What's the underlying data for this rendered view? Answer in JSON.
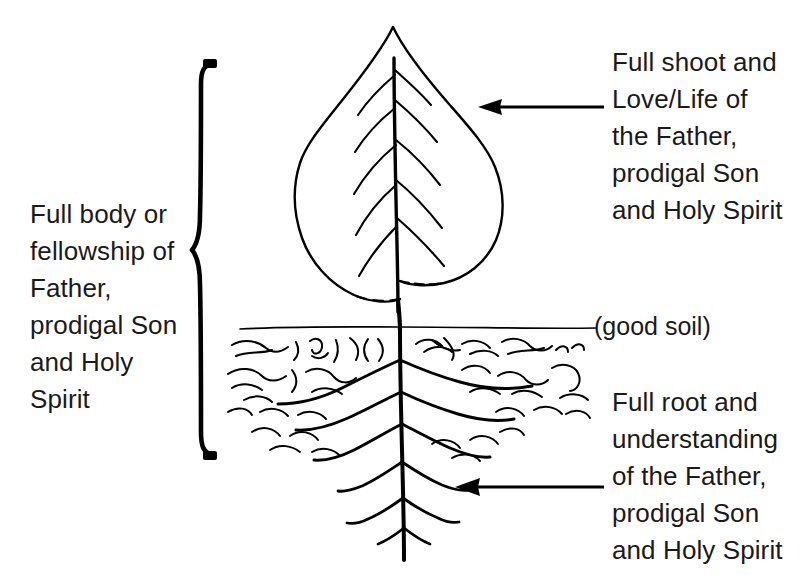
{
  "diagram": {
    "background_color": "#ffffff",
    "ink_color": "#000000"
  },
  "labels": {
    "left_bracket_label": "Full body or\nfellowship of\nFather,\nprodigal Son\nand Holy\nSpirit",
    "shoot_label": "Full shoot and\nLove/Life of\nthe Father,\nprodigal Son\nand Holy Spirit",
    "root_label": "Full root and\nunderstanding\nof the Father,\nprodigal Son\nand Holy Spirit",
    "soil_label": "(good soil)"
  },
  "parts": {
    "leaf": "leaf-shape",
    "midrib": "leaf-midrib",
    "veins": "leaf-veins",
    "stem": "plant-stem",
    "ground_line": "soil-surface-line",
    "soil_texture": "soil-squiggles",
    "lateral_roots": "lateral-root-system",
    "taproot": "taproot",
    "brace": "curly-brace",
    "arrow_shoot": "arrow-pointing-to-shoot",
    "arrow_root": "arrow-pointing-to-root"
  }
}
